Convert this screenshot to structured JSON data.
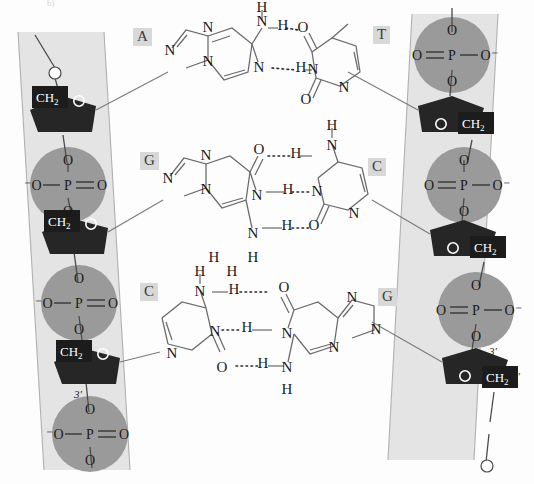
{
  "figure": {
    "type": "molecular-structure-diagram",
    "corner_mark": "b)"
  },
  "colors": {
    "background": "#fdfdfd",
    "ribbon": "#e4e4e4",
    "ribbon_edge": "#b6b6b6",
    "phosphate_circle": "#9a9a9a",
    "sugar_fill": "#262626",
    "ch2_box": "#1c1c1c",
    "bond_stroke": "#4a4a4a",
    "base_label_box": "#d8d8d8",
    "text": "#1a1a1a"
  },
  "base_pairs": [
    {
      "index": 1,
      "left_base": "A",
      "left_base_name": "Adenine",
      "left_type": "purine",
      "right_base": "T",
      "right_base_name": "Thymine",
      "right_type": "pyrimidine",
      "hydrogen_bonds": 2,
      "bond_labels": [
        "N-H···O",
        "N···H-N"
      ]
    },
    {
      "index": 2,
      "left_base": "G",
      "left_base_name": "Guanine",
      "left_type": "purine",
      "right_base": "C",
      "right_base_name": "Cytosine",
      "right_type": "pyrimidine",
      "hydrogen_bonds": 3,
      "bond_labels": [
        "O···H-N",
        "N-H···N",
        "N-H···O"
      ]
    },
    {
      "index": 3,
      "left_base": "C",
      "left_base_name": "Cytosine",
      "left_type": "pyrimidine",
      "right_base": "G",
      "right_base_name": "Guanine",
      "right_type": "purine",
      "hydrogen_bonds": 3,
      "bond_labels": [
        "N-H···O",
        "N···H-N",
        "O···H-N"
      ]
    }
  ],
  "atoms": {
    "nitrogen": "N",
    "oxygen": "O",
    "hydrogen": "H",
    "phosphorus": "P",
    "methylene": "CH",
    "methylene_sub": "2"
  },
  "backbone_left": {
    "strand_label": "left-strand",
    "direction_top_to_bottom": "5' to 3'",
    "prime_labels": [
      {
        "text": "5'",
        "position": "mid-lower"
      },
      {
        "text": "3'",
        "position": "lower"
      }
    ],
    "phosphate_groups": 4,
    "sugar_groups": 3,
    "phosphate_formula": [
      "⁻O",
      "P",
      "O",
      "O",
      "O"
    ]
  },
  "backbone_right": {
    "strand_label": "right-strand",
    "direction_top_to_bottom": "3' to 5'",
    "prime_labels": [
      {
        "text": "3'",
        "position": "lower"
      },
      {
        "text": "5'",
        "position": "lower-end"
      }
    ],
    "phosphate_groups": 3,
    "sugar_groups": 3,
    "phosphate_formula": [
      "O",
      "P",
      "⁻O",
      "O",
      "O"
    ]
  },
  "legend_notes": {
    "hbond_style": "dotted",
    "antiparallel": true
  }
}
